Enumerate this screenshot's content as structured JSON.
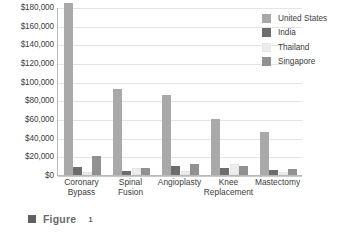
{
  "caption": {
    "bullet_icon": "square-bullet-icon",
    "word": "Figure",
    "number": "1"
  },
  "legend": {
    "position": "top-right",
    "items": [
      {
        "label": "United States",
        "color": "#a9a9a9"
      },
      {
        "label": "India",
        "color": "#6d6d6d"
      },
      {
        "label": "Thailand",
        "color": "#ededed"
      },
      {
        "label": "Singapore",
        "color": "#919191"
      }
    ]
  },
  "chart_data": {
    "type": "bar",
    "title": "",
    "subtitle": "",
    "xlabel": "",
    "ylabel": "",
    "grid": true,
    "legend_position": "top-right",
    "ylim": [
      0,
      180000
    ],
    "ytick_values": [
      0,
      20000,
      40000,
      60000,
      80000,
      100000,
      120000,
      140000,
      160000,
      180000
    ],
    "ytick_labels": [
      "$0",
      "$20,000",
      "$40,000",
      "$60,000",
      "$80,000",
      "$100,000",
      "$120,000",
      "$140,000",
      "$160,000",
      "$180,000"
    ],
    "categories": [
      "Coronary Bypass",
      "Spinal Fusion",
      "Angioplasty",
      "Knee Replacement",
      "Mastectomy"
    ],
    "category_lines": [
      [
        "Coronary",
        "Bypass"
      ],
      [
        "Spinal",
        "Fusion"
      ],
      [
        "Angioplasty",
        ""
      ],
      [
        "Knee",
        "Replacement"
      ],
      [
        "Mastectomy",
        ""
      ]
    ],
    "series": [
      {
        "name": "United States",
        "color": "#a9a9a9",
        "values": [
          184000,
          92000,
          86000,
          60000,
          46000
        ]
      },
      {
        "name": "India",
        "color": "#6d6d6d",
        "values": [
          9000,
          4000,
          10000,
          7000,
          5000
        ]
      },
      {
        "name": "Thailand",
        "color": "#ededed",
        "values": [
          3000,
          7000,
          4000,
          12000,
          3000
        ]
      },
      {
        "name": "Singapore",
        "color": "#919191",
        "values": [
          20000,
          7000,
          12000,
          10000,
          6000
        ]
      }
    ]
  }
}
